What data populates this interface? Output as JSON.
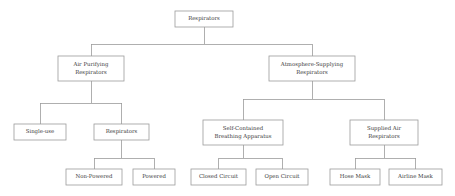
{
  "diagram": {
    "type": "hierarchy-tree",
    "background_color": "#ffffff",
    "box_border_color": "#9b9b9b",
    "connector_color": "#9b9b9b",
    "text_color": "#3a3a3a",
    "nodes": [
      {
        "id": "respirators",
        "label": "Respirators",
        "lines": [
          "Respirators"
        ],
        "level": 0,
        "x": 175,
        "y": 11,
        "w": 58,
        "h": 16
      },
      {
        "id": "air-purifying-respirators",
        "label": "Air Purifying Respirators",
        "lines": [
          "Air Purifying",
          "Respirators"
        ],
        "level": 1,
        "x": 58,
        "y": 56,
        "w": 66,
        "h": 25
      },
      {
        "id": "atmosphere-supplying-respirators",
        "label": "Atmosphere-Supplying Respirators",
        "lines": [
          "Atmosphere-Supplying",
          "Respirators"
        ],
        "level": 1,
        "x": 269,
        "y": 56,
        "w": 86,
        "h": 25
      },
      {
        "id": "single-use",
        "label": "Single-use",
        "lines": [
          "Single-use"
        ],
        "level": 2,
        "x": 14,
        "y": 124,
        "w": 52,
        "h": 16
      },
      {
        "id": "respirators-reusable",
        "label": "Respirators",
        "lines": [
          "Respirators"
        ],
        "level": 2,
        "x": 94,
        "y": 124,
        "w": 55,
        "h": 16
      },
      {
        "id": "self-contained-breathing-apparatus",
        "label": "Self-Contained Breathing Apparatus",
        "lines": [
          "Self-Contained",
          "Breathing Apparatus"
        ],
        "level": 2,
        "x": 203,
        "y": 120,
        "w": 80,
        "h": 25
      },
      {
        "id": "supplied-air-respirators",
        "label": "Supplied Air Respirators",
        "lines": [
          "Supplied Air",
          "Respirators"
        ],
        "level": 2,
        "x": 350,
        "y": 120,
        "w": 68,
        "h": 25
      },
      {
        "id": "non-powered",
        "label": "Non-Powered",
        "lines": [
          "Non-Powered"
        ],
        "level": 3,
        "x": 66,
        "y": 169,
        "w": 56,
        "h": 16
      },
      {
        "id": "powered",
        "label": "Powered",
        "lines": [
          "Powered"
        ],
        "level": 3,
        "x": 133,
        "y": 169,
        "w": 42,
        "h": 16
      },
      {
        "id": "closed-circuit",
        "label": "Closed Circuit",
        "lines": [
          "Closed Circuit"
        ],
        "level": 3,
        "x": 191,
        "y": 169,
        "w": 55,
        "h": 16
      },
      {
        "id": "open-circuit",
        "label": "Open Circuit",
        "lines": [
          "Open Circuit"
        ],
        "level": 3,
        "x": 256,
        "y": 169,
        "w": 52,
        "h": 16
      },
      {
        "id": "hose-mask",
        "label": "Hose Mask",
        "lines": [
          "Hose Mask"
        ],
        "level": 3,
        "x": 330,
        "y": 169,
        "w": 50,
        "h": 16
      },
      {
        "id": "airline-mask",
        "label": "Airline Mask",
        "lines": [
          "Airline Mask"
        ],
        "level": 3,
        "x": 389,
        "y": 169,
        "w": 53,
        "h": 16
      }
    ],
    "edges": [
      {
        "id": "edge-root-split",
        "parent": "respirators",
        "children": [
          "air-purifying-respirators",
          "atmosphere-supplying-respirators"
        ],
        "bus_y": 44
      },
      {
        "id": "edge-apr-split",
        "parent": "air-purifying-respirators",
        "children": [
          "single-use",
          "respirators-reusable"
        ],
        "bus_y": 103
      },
      {
        "id": "edge-asr-split",
        "parent": "atmosphere-supplying-respirators",
        "children": [
          "self-contained-breathing-apparatus",
          "supplied-air-respirators"
        ],
        "bus_y": 99
      },
      {
        "id": "edge-reusable-split",
        "parent": "respirators-reusable",
        "children": [
          "non-powered",
          "powered"
        ],
        "bus_y": 158
      },
      {
        "id": "edge-scba-split",
        "parent": "self-contained-breathing-apparatus",
        "children": [
          "closed-circuit",
          "open-circuit"
        ],
        "bus_y": 158
      },
      {
        "id": "edge-sar-split",
        "parent": "supplied-air-respirators",
        "children": [
          "hose-mask",
          "airline-mask"
        ],
        "bus_y": 158
      }
    ]
  }
}
